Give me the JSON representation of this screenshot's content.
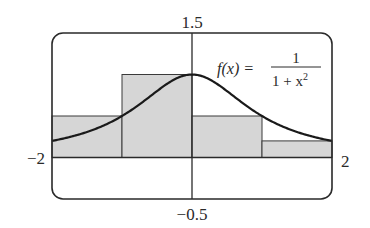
{
  "chart_data": {
    "type": "bar",
    "subtype": "riemann-sum-with-curve",
    "title": "",
    "function_label": {
      "lhs": "f(x) =",
      "numerator": "1",
      "denominator": "1 + x",
      "exponent": "2"
    },
    "window": {
      "xmin": -2,
      "xmax": 2,
      "ymin": -0.5,
      "ymax": 1.5
    },
    "tick_labels": {
      "xmin": "−2",
      "xmax": "2",
      "ymin": "−0.5",
      "ymax": "1.5"
    },
    "categories": [
      "[-2,-1]",
      "[-1,0]",
      "[0,1]",
      "[1,2]"
    ],
    "rectangles": [
      {
        "x0": -2,
        "x1": -1,
        "height": 0.5
      },
      {
        "x0": -1,
        "x1": 0,
        "height": 1.0
      },
      {
        "x0": 0,
        "x1": 1,
        "height": 0.5
      },
      {
        "x0": 1,
        "x1": 2,
        "height": 0.2
      }
    ],
    "values": [
      0.5,
      1.0,
      0.5,
      0.2
    ],
    "curve": {
      "expression": "1/(1+x^2)",
      "x": [
        -2,
        -1.5,
        -1,
        -0.5,
        0,
        0.5,
        1,
        1.5,
        2
      ],
      "y": [
        0.2,
        0.3077,
        0.5,
        0.8,
        1.0,
        0.8,
        0.5,
        0.3077,
        0.2
      ]
    },
    "xlabel": "",
    "ylabel": "",
    "grid": false,
    "legend": null
  },
  "colors": {
    "rect_fill": "#d6d6d6",
    "rect_stroke": "#3a3a3a",
    "curve": "#1a1a1a",
    "frame": "#2a2a2a",
    "axes": "#2a2a2a",
    "text": "#2a2a2a"
  }
}
